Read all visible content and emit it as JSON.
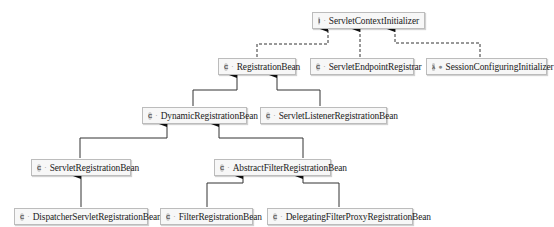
{
  "diagram": {
    "type": "class-hierarchy",
    "nodes": [
      {
        "id": "sci",
        "label": "ServletContextInitializer",
        "kind": "interface",
        "kind_glyph": "I",
        "visibility_glyph": "·"
      },
      {
        "id": "rb",
        "label": "RegistrationBean",
        "kind": "class",
        "kind_glyph": "C",
        "visibility_glyph": "·"
      },
      {
        "id": "ser",
        "label": "ServletEndpointRegistrar",
        "kind": "class",
        "kind_glyph": "C",
        "visibility_glyph": "·"
      },
      {
        "id": "sci2",
        "label": "SessionConfiguringInitializer",
        "kind": "lambda",
        "kind_glyph": "λ",
        "visibility_glyph": "●"
      },
      {
        "id": "drb",
        "label": "DynamicRegistrationBean",
        "kind": "class",
        "kind_glyph": "C",
        "visibility_glyph": "·"
      },
      {
        "id": "slrb",
        "label": "ServletListenerRegistrationBean",
        "kind": "class",
        "kind_glyph": "C",
        "visibility_glyph": "·"
      },
      {
        "id": "srb",
        "label": "ServletRegistrationBean",
        "kind": "class",
        "kind_glyph": "C",
        "visibility_glyph": "·"
      },
      {
        "id": "afrb",
        "label": "AbstractFilterRegistrationBean",
        "kind": "class",
        "kind_glyph": "C",
        "visibility_glyph": "·"
      },
      {
        "id": "dsrb",
        "label": "DispatcherServletRegistrationBean",
        "kind": "class",
        "kind_glyph": "C",
        "visibility_glyph": "·"
      },
      {
        "id": "frb",
        "label": "FilterRegistrationBean",
        "kind": "class",
        "kind_glyph": "C",
        "visibility_glyph": "·"
      },
      {
        "id": "dfpr",
        "label": "DelegatingFilterProxyRegistrationBean",
        "kind": "class",
        "kind_glyph": "C",
        "visibility_glyph": "·"
      }
    ],
    "edges": [
      {
        "from": "rb",
        "to": "sci",
        "style": "dashed",
        "meaning": "implements"
      },
      {
        "from": "ser",
        "to": "sci",
        "style": "dashed",
        "meaning": "implements"
      },
      {
        "from": "sci2",
        "to": "sci",
        "style": "dashed",
        "meaning": "implements"
      },
      {
        "from": "drb",
        "to": "rb",
        "style": "solid",
        "meaning": "extends"
      },
      {
        "from": "slrb",
        "to": "rb",
        "style": "solid",
        "meaning": "extends"
      },
      {
        "from": "srb",
        "to": "drb",
        "style": "solid",
        "meaning": "extends"
      },
      {
        "from": "afrb",
        "to": "drb",
        "style": "solid",
        "meaning": "extends"
      },
      {
        "from": "dsrb",
        "to": "srb",
        "style": "solid",
        "meaning": "extends"
      },
      {
        "from": "frb",
        "to": "afrb",
        "style": "solid",
        "meaning": "extends"
      },
      {
        "from": "dfpr",
        "to": "afrb",
        "style": "solid",
        "meaning": "extends"
      }
    ]
  }
}
